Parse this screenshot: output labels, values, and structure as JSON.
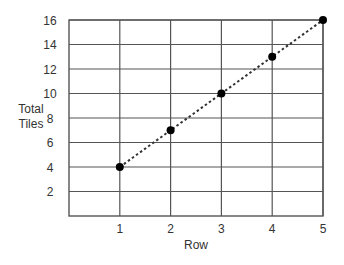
{
  "chart_data": {
    "type": "line",
    "title": "",
    "xlabel": "Row",
    "ylabel": "Total Tiles",
    "ylabel_lines": [
      "Total",
      "Tiles"
    ],
    "x": [
      1,
      2,
      3,
      4,
      5
    ],
    "values": [
      4,
      7,
      10,
      13,
      16
    ],
    "series": [
      {
        "name": "Total Tiles",
        "x": [
          1,
          2,
          3,
          4,
          5
        ],
        "values": [
          4,
          7,
          10,
          13,
          16
        ],
        "line_style": "dotted",
        "marker": "filled-circle"
      }
    ],
    "xlim": [
      0,
      5
    ],
    "ylim": [
      0,
      16
    ],
    "xticks": [
      1,
      2,
      3,
      4,
      5
    ],
    "yticks": [
      2,
      4,
      6,
      8,
      10,
      12,
      14,
      16
    ],
    "grid": true,
    "legend": null
  },
  "colors": {
    "grid": "#555555",
    "line": "#333333",
    "marker": "#000000",
    "text": "#333333"
  }
}
